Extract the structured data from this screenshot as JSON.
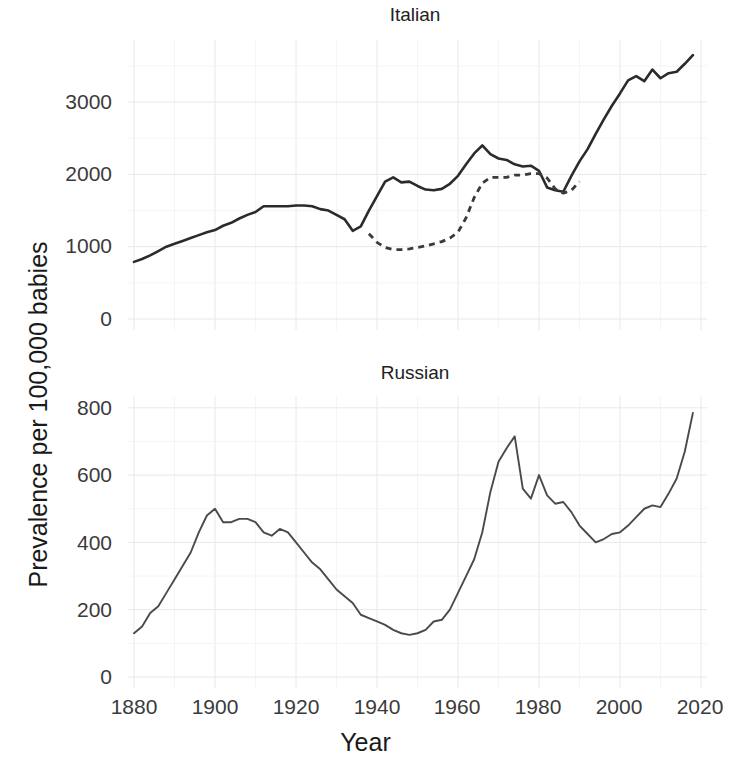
{
  "axis_titles": {
    "y": "Prevalence per 100,000 babies",
    "x": "Year"
  },
  "panels": [
    {
      "title": "Italian"
    },
    {
      "title": "Russian"
    }
  ],
  "ticks": {
    "x": [
      "1880",
      "1900",
      "1920",
      "1940",
      "1960",
      "1980",
      "2000",
      "2020"
    ],
    "y_italian": [
      "3000",
      "2000",
      "1000",
      "0"
    ],
    "y_russian": [
      "800",
      "600",
      "400",
      "200",
      "0"
    ]
  },
  "colors": {
    "line": "#2b2b2b",
    "grid": "#e8e8ea",
    "background": "#ffffff",
    "text": "#1a1a1a"
  },
  "chart_data": {
    "type": "line",
    "title": "",
    "xlabel": "Year",
    "ylabel": "Prevalence per 100,000 babies",
    "grid": true,
    "legend": "none",
    "facets": [
      {
        "name": "Italian",
        "ylim": [
          0,
          3700
        ],
        "yticks": [
          0,
          1000,
          2000,
          3000
        ],
        "xlim": [
          1880,
          2020
        ],
        "xticks": [
          1880,
          1900,
          1920,
          1940,
          1960,
          1980,
          2000,
          2020
        ],
        "series": [
          {
            "name": "solid",
            "style": "solid",
            "x": [
              1880,
              1882,
              1884,
              1886,
              1888,
              1890,
              1892,
              1894,
              1896,
              1898,
              1900,
              1902,
              1904,
              1906,
              1908,
              1910,
              1912,
              1914,
              1916,
              1918,
              1920,
              1922,
              1924,
              1926,
              1928,
              1930,
              1932,
              1934,
              1936,
              1938,
              1940,
              1942,
              1944,
              1946,
              1948,
              1950,
              1952,
              1954,
              1956,
              1958,
              1960,
              1962,
              1964,
              1966,
              1968,
              1970,
              1972,
              1974,
              1976,
              1978,
              1980,
              1982,
              1984,
              1986,
              1988,
              1990,
              1992,
              1994,
              1996,
              1998,
              2000,
              2002,
              2004,
              2006,
              2008,
              2010,
              2012,
              2014,
              2016,
              2018
            ],
            "values": [
              790,
              830,
              880,
              940,
              1000,
              1040,
              1080,
              1120,
              1160,
              1200,
              1230,
              1290,
              1330,
              1390,
              1440,
              1480,
              1560,
              1560,
              1560,
              1560,
              1570,
              1570,
              1560,
              1520,
              1500,
              1440,
              1380,
              1220,
              1280,
              1500,
              1700,
              1900,
              1960,
              1890,
              1900,
              1840,
              1790,
              1780,
              1800,
              1870,
              1980,
              2140,
              2290,
              2400,
              2280,
              2220,
              2200,
              2140,
              2110,
              2120,
              2050,
              1820,
              1780,
              1760,
              1980,
              2180,
              2350,
              2560,
              2760,
              2950,
              3120,
              3300,
              3360,
              3290,
              3450,
              3330,
              3400,
              3420,
              3530,
              3650
            ]
          },
          {
            "name": "dashed",
            "style": "dashed",
            "x": [
              1938,
              1940,
              1942,
              1944,
              1946,
              1948,
              1950,
              1952,
              1954,
              1956,
              1958,
              1960,
              1962,
              1964,
              1966,
              1968,
              1970,
              1972,
              1974,
              1976,
              1978,
              1980,
              1982,
              1984,
              1986,
              1988,
              1990
            ],
            "values": [
              1180,
              1060,
              990,
              960,
              960,
              970,
              990,
              1010,
              1040,
              1070,
              1120,
              1200,
              1400,
              1680,
              1880,
              1960,
              1960,
              1960,
              1990,
              1990,
              2010,
              2010,
              1950,
              1800,
              1740,
              1780,
              1900
            ]
          }
        ]
      },
      {
        "name": "Russian",
        "ylim": [
          0,
          810
        ],
        "yticks": [
          0,
          200,
          400,
          600,
          800
        ],
        "xlim": [
          1880,
          2020
        ],
        "xticks": [
          1880,
          1900,
          1920,
          1940,
          1960,
          1980,
          2000,
          2020
        ],
        "series": [
          {
            "name": "solid",
            "style": "solid",
            "x": [
              1880,
              1882,
              1884,
              1886,
              1888,
              1890,
              1892,
              1894,
              1896,
              1898,
              1900,
              1902,
              1904,
              1906,
              1908,
              1910,
              1912,
              1914,
              1916,
              1918,
              1920,
              1922,
              1924,
              1926,
              1928,
              1930,
              1932,
              1934,
              1936,
              1938,
              1940,
              1942,
              1944,
              1946,
              1948,
              1950,
              1952,
              1954,
              1956,
              1958,
              1960,
              1962,
              1964,
              1966,
              1968,
              1970,
              1972,
              1974,
              1976,
              1978,
              1980,
              1982,
              1984,
              1986,
              1988,
              1990,
              1992,
              1994,
              1996,
              1998,
              2000,
              2002,
              2004,
              2006,
              2008,
              2010,
              2012,
              2014,
              2016,
              2018
            ],
            "values": [
              130,
              150,
              190,
              210,
              250,
              290,
              330,
              370,
              430,
              480,
              500,
              460,
              460,
              470,
              470,
              460,
              430,
              420,
              440,
              430,
              400,
              370,
              340,
              320,
              290,
              260,
              240,
              220,
              185,
              175,
              165,
              155,
              140,
              130,
              125,
              130,
              140,
              165,
              170,
              200,
              250,
              300,
              350,
              430,
              550,
              640,
              680,
              715,
              560,
              530,
              600,
              540,
              515,
              520,
              490,
              450,
              425,
              400,
              410,
              425,
              430,
              450,
              475,
              500,
              510,
              505,
              545,
              590,
              670,
              785
            ]
          }
        ]
      }
    ]
  }
}
